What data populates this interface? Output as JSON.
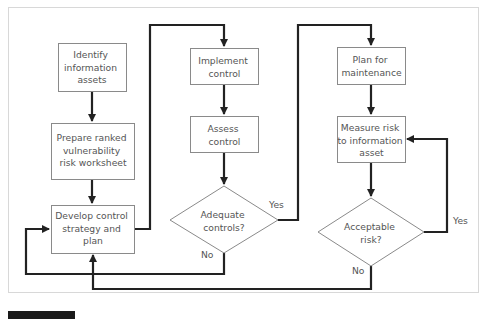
{
  "figure": {
    "frame_color": "#d8d8d8",
    "line_color": "#222222",
    "box_border_color": "#8a8a8a",
    "text_color": "#555555"
  },
  "nodes": {
    "identify": {
      "lines": [
        "Identify",
        "information",
        "assets"
      ]
    },
    "prepare": {
      "lines": [
        "Prepare ranked",
        "vulnerability",
        "risk worksheet"
      ]
    },
    "develop": {
      "lines": [
        "Develop control",
        "strategy and",
        "plan"
      ]
    },
    "implement": {
      "lines": [
        "Implement",
        "control"
      ]
    },
    "assess": {
      "lines": [
        "Assess",
        "control"
      ]
    },
    "adequate": {
      "lines": [
        "Adequate",
        "controls?"
      ]
    },
    "plan": {
      "lines": [
        "Plan for",
        "maintenance"
      ]
    },
    "measure": {
      "lines": [
        "Measure risk",
        "to information",
        "asset"
      ]
    },
    "acceptable": {
      "lines": [
        "Acceptable",
        "risk?"
      ]
    }
  },
  "edge_labels": {
    "adequate_yes": "Yes",
    "adequate_no": "No",
    "acceptable_yes": "Yes",
    "acceptable_no": "No"
  }
}
